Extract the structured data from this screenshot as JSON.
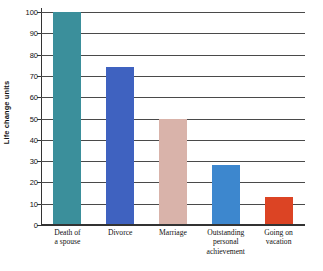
{
  "chart_data": {
    "type": "bar",
    "title": "",
    "subtitle": "",
    "xlabel": "",
    "ylabel": "Life change units",
    "categories": [
      "Death of a spouse",
      "Divorce",
      "Marriage",
      "Outstanding personal achievement",
      "Going on vacation"
    ],
    "category_lines": [
      [
        "Death of",
        "a spouse"
      ],
      [
        "Divorce"
      ],
      [
        "Marriage"
      ],
      [
        "Outstanding",
        "personal",
        "achievement"
      ],
      [
        "Going on",
        "vacation"
      ]
    ],
    "values": [
      100,
      74,
      50,
      28,
      13
    ],
    "bar_colors": [
      "#3b8f9b",
      "#3f62c0",
      "#d9b3aa",
      "#3d87ce",
      "#dc4424"
    ],
    "ylim": [
      0,
      100
    ],
    "ytick_values": [
      0,
      10,
      20,
      30,
      40,
      50,
      60,
      70,
      80,
      90,
      100
    ],
    "ytick_labels": [
      "0",
      "10",
      "20",
      "30",
      "40",
      "50",
      "60",
      "70",
      "80",
      "90",
      "100"
    ],
    "grid": "horizontal",
    "legend": "none",
    "annotations": []
  },
  "colors": {
    "background": "#ffffff",
    "axis": "#333333",
    "gridline": "#4a4a4a",
    "text": "#111111"
  }
}
